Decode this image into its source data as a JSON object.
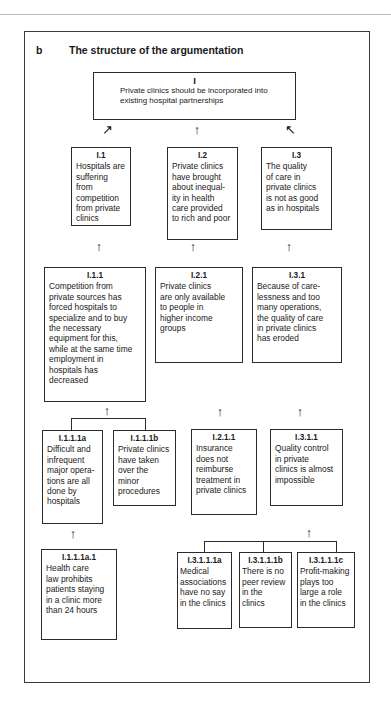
{
  "heading": {
    "letter": "b",
    "title": "The structure of the argumentation"
  },
  "icons": {
    "arrow_up": "↑",
    "arrow_up_right": "↗",
    "arrow_up_left": "↖"
  },
  "nodes": {
    "n1": {
      "label": "I",
      "text": "Private clinics should be incorporated into\nexisting hospital partnerships"
    },
    "n1_1": {
      "label": "I.1",
      "text": "Hospitals are\nsuffering from\ncompetition\nfrom private\nclinics"
    },
    "n1_2": {
      "label": "I.2",
      "text": "Private clinics\nhave brought\nabout inequal-\nity in health\ncare provided\nto rich and poor"
    },
    "n1_3": {
      "label": "I.3",
      "text": "The quality\nof care in\nprivate clinics\nis not as good\nas in hospitals"
    },
    "n1_1_1": {
      "label": "I.1.1",
      "text": "Competition from\nprivate sources has\nforced hospitals to\nspecialize and to buy\nthe necessary\nequipment for this,\nwhile at the same time\nemployment in\nhospitals has\ndecreased"
    },
    "n1_2_1": {
      "label": "I.2.1",
      "text": "Private clinics\nare only available\nto people in\nhigher income\ngroups"
    },
    "n1_3_1": {
      "label": "I.3.1",
      "text": "Because of care-\nlessness and too\nmany operations,\nthe quality of care\nin private clinics\nhas eroded"
    },
    "n1_1_1_a": {
      "label": "I.1.1.1a",
      "text": "Difficult and\ninfrequent\nmajor opera-\ntions are all\ndone by\nhospitals"
    },
    "n1_1_1_b": {
      "label": "I.1.1.1b",
      "text": "Private clinics\nhave taken\nover the minor\nprocedures"
    },
    "n1_2_1_1": {
      "label": "I.2.1.1",
      "text": "Insurance\ndoes not\nreimburse\ntreatment in\nprivate clinics"
    },
    "n1_3_1_1": {
      "label": "I.3.1.1",
      "text": "Quality control\nin private\nclinics is almost\nimpossible"
    },
    "n1_1_1_a_1": {
      "label": "I.1.1.1a.1",
      "text": "Health care\nlaw prohibits\npatients staying\nin a clinic more\nthan 24 hours"
    },
    "n1_3_1_1_a": {
      "label": "I.3.1.1.1a",
      "text": "Medical\nassociations\nhave no say\nin the clinics"
    },
    "n1_3_1_1_b": {
      "label": "I.3.1.1.1b",
      "text": "There is no\npeer review\nin the\nclinics"
    },
    "n1_3_1_1_c": {
      "label": "I.3.1.1.1c",
      "text": "Profit-making\nplays too\nlarge a role\nin the clinics"
    }
  }
}
